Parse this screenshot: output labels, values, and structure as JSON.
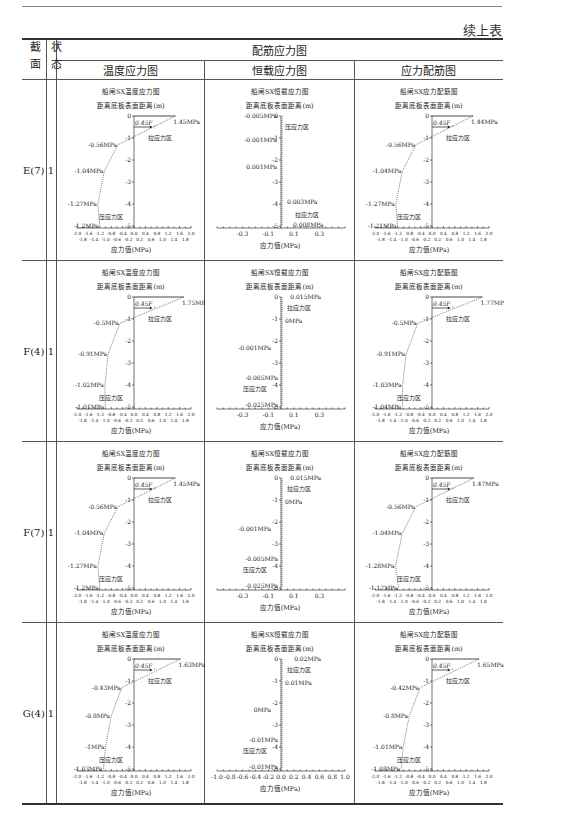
{
  "continued_label": "续上表",
  "header": {
    "col_section": "截面",
    "col_state": "状态",
    "group": "配筋应力图",
    "sub": [
      "温度应力图",
      "恒载应力图",
      "应力配筋图"
    ]
  },
  "common": {
    "ylabel": "距离底板表面距离(m)",
    "xlabel": "应力值(MPa)",
    "tension_zone": "拉应力区",
    "compression_zone": "压应力区",
    "fs_label": "0.45F",
    "fs_sub": "t",
    "titles": [
      "船闸SX温度应力图",
      "船闸SX恒载应力图",
      "船闸SX应力配筋图"
    ]
  },
  "rows": [
    {
      "section": "E(7)",
      "state": "1"
    },
    {
      "section": "F(4)",
      "state": "1"
    },
    {
      "section": "F(7)",
      "state": "1"
    },
    {
      "section": "G(4)",
      "state": "1"
    }
  ],
  "chart_data": [
    {
      "row": "E(7)",
      "type": "line",
      "title": "船闸SX温度应力图",
      "xlim": [
        -2,
        2
      ],
      "ylim": [
        -5,
        0
      ],
      "top": "1.45MPa",
      "labels": [
        "-0.56MPa",
        "-1.04MPa",
        "-1.27MPa",
        "-1.2MPa"
      ],
      "points": [
        [
          1.45,
          0
        ],
        [
          -0.56,
          -1.3
        ],
        [
          -1.04,
          -2.5
        ],
        [
          -1.27,
          -4.0
        ],
        [
          -1.2,
          -5.0
        ]
      ]
    },
    {
      "row": "E(7)",
      "type": "line",
      "title": "船闸SX恒载应力图",
      "xlim": [
        -0.5,
        0.5
      ],
      "ylim": [
        -5,
        0
      ],
      "labels": [
        "-0.005MPa",
        "-0.001MPa",
        "0.001MPa",
        "0.003MPa",
        "0.008MPa"
      ]
    },
    {
      "row": "E(7)",
      "type": "line",
      "title": "船闸SX应力配筋图",
      "xlim": [
        -2,
        2
      ],
      "ylim": [
        -5,
        0
      ],
      "top": "1.44MPa",
      "labels": [
        "-0.56MPa",
        "-1.04MPa",
        "-1.27MPa",
        "-1.21MPa"
      ],
      "points": [
        [
          1.44,
          0
        ],
        [
          -0.56,
          -1.3
        ],
        [
          -1.04,
          -2.5
        ],
        [
          -1.27,
          -4.0
        ],
        [
          -1.21,
          -5.0
        ]
      ]
    },
    {
      "row": "F(4)",
      "type": "line",
      "title": "船闸SX温度应力图",
      "xlim": [
        -2,
        2
      ],
      "ylim": [
        -5,
        0
      ],
      "top": "1.75MPa",
      "labels": [
        "-0.5MPa",
        "-0.91MPa",
        "-1.02MPa",
        "-1.01MPa"
      ],
      "points": [
        [
          1.75,
          0
        ],
        [
          -0.5,
          -1.2
        ],
        [
          -0.91,
          -2.6
        ],
        [
          -1.02,
          -4.0
        ],
        [
          -1.01,
          -5.0
        ]
      ]
    },
    {
      "row": "F(4)",
      "type": "line",
      "title": "船闸SX恒载应力图",
      "xlim": [
        -0.5,
        0.5
      ],
      "ylim": [
        -5,
        0
      ],
      "labels": [
        "0.015MPa",
        "0MPa",
        "-0.001MPa",
        "-0.005MPa",
        "-0.025MPa"
      ]
    },
    {
      "row": "F(4)",
      "type": "line",
      "title": "船闸SX应力配筋图",
      "xlim": [
        -2,
        2
      ],
      "ylim": [
        -5,
        0
      ],
      "top": "1.77MPa",
      "labels": [
        "-0.5MPa",
        "-0.91MPa",
        "-1.03MPa",
        "-1.04MPa"
      ],
      "points": [
        [
          1.77,
          0
        ],
        [
          -0.5,
          -1.2
        ],
        [
          -0.91,
          -2.6
        ],
        [
          -1.03,
          -4.0
        ],
        [
          -1.04,
          -5.0
        ]
      ]
    },
    {
      "row": "F(7)",
      "type": "line",
      "title": "船闸SX温度应力图",
      "xlim": [
        -2,
        2
      ],
      "ylim": [
        -5,
        0
      ],
      "top": "1.45MPa",
      "labels": [
        "-0.56MPa",
        "-1.04MPa",
        "-1.27MPa",
        "-1.2MPa"
      ],
      "points": [
        [
          1.45,
          0
        ],
        [
          -0.56,
          -1.3
        ],
        [
          -1.04,
          -2.5
        ],
        [
          -1.27,
          -4.0
        ],
        [
          -1.2,
          -5.0
        ]
      ]
    },
    {
      "row": "F(7)",
      "type": "line",
      "title": "船闸SX恒载应力图",
      "xlim": [
        -0.5,
        0.5
      ],
      "ylim": [
        -5,
        0
      ],
      "labels": [
        "0.015MPa",
        "0MPa",
        "-0.001MPa",
        "-0.005MPa",
        "-0.025MPa"
      ]
    },
    {
      "row": "F(7)",
      "type": "line",
      "title": "船闸SX应力配筋图",
      "xlim": [
        -2,
        2
      ],
      "ylim": [
        -5,
        0
      ],
      "top": "1.47MPa",
      "labels": [
        "-0.56MPa",
        "-1.04MPa",
        "-1.28MPa",
        "-1.17MPa"
      ],
      "points": [
        [
          1.47,
          0
        ],
        [
          -0.56,
          -1.3
        ],
        [
          -1.04,
          -2.5
        ],
        [
          -1.28,
          -4.0
        ],
        [
          -1.17,
          -5.0
        ]
      ]
    },
    {
      "row": "G(4)",
      "type": "line",
      "title": "船闸SX温度应力图",
      "xlim": [
        -2,
        2
      ],
      "ylim": [
        -5,
        0
      ],
      "top": "1.63MPa",
      "labels": [
        "-0.43MPa",
        "-0.8MPa",
        "-1MPa",
        "-1.07MPa"
      ],
      "points": [
        [
          1.63,
          0
        ],
        [
          -0.43,
          -1.3
        ],
        [
          -0.8,
          -2.6
        ],
        [
          -1.0,
          -4.0
        ],
        [
          -1.07,
          -5.0
        ]
      ]
    },
    {
      "row": "G(4)",
      "type": "line",
      "title": "船闸SX恒载应力图",
      "xlim": [
        -1,
        1
      ],
      "ylim": [
        -5,
        0
      ],
      "labels": [
        "0.02MPa",
        "0.01MPa",
        "0MPa",
        "-0.01MPa",
        "-0.01MPa"
      ]
    },
    {
      "row": "G(4)",
      "type": "line",
      "title": "船闸SX应力配筋图",
      "xlim": [
        -2,
        2
      ],
      "ylim": [
        -5,
        0
      ],
      "top": "1.65MPa",
      "labels": [
        "-0.42MPa",
        "-0.8MPa",
        "-1.01MPa",
        "-1.08MPa"
      ],
      "points": [
        [
          1.65,
          0
        ],
        [
          -0.42,
          -1.3
        ],
        [
          -0.8,
          -2.6
        ],
        [
          -1.01,
          -4.0
        ],
        [
          -1.08,
          -5.0
        ]
      ]
    }
  ]
}
